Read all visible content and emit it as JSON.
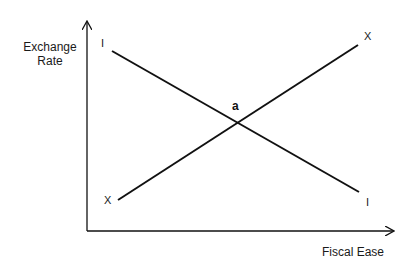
{
  "diagram": {
    "axes": {
      "y_label_line1": "Exchange",
      "y_label_line2": "Rate",
      "x_label": "Fiscal Ease"
    },
    "curves": [
      {
        "name": "I",
        "start_label": "I",
        "end_label": "I",
        "slope": "downward"
      },
      {
        "name": "X",
        "start_label": "X",
        "end_label": "X",
        "slope": "upward"
      }
    ],
    "intersection_label": "a",
    "colors": {
      "line": "#111111",
      "background": "#ffffff"
    }
  }
}
